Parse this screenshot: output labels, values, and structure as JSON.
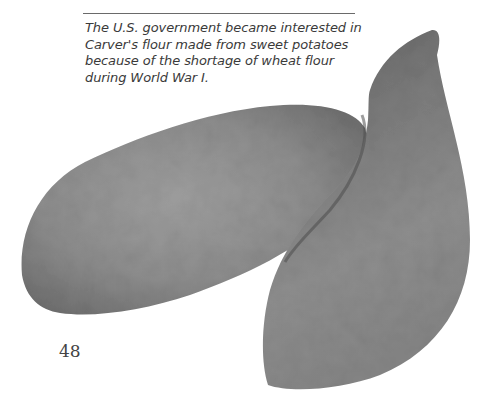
{
  "caption": {
    "lines": [
      "The U.S. government became interested in",
      "Carver's flour made from sweet potatoes",
      "because of the shortage of wheat flour",
      "during World War I."
    ]
  },
  "page_number": "48",
  "image": {
    "subject": "two sweet potatoes (grayscale photograph)",
    "colors": {
      "skin_mid": "#8a8a8a",
      "skin_dark": "#6c6c6c",
      "skin_light": "#a8a8a8"
    }
  }
}
